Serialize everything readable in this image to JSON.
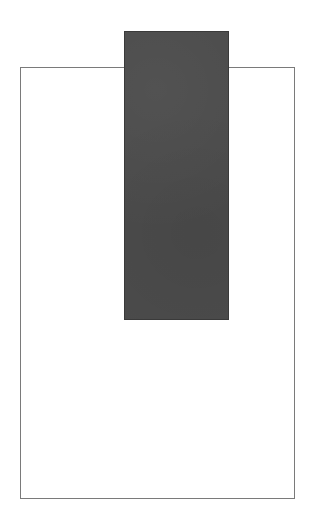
{
  "canvas": {
    "width": 314,
    "height": 529,
    "background": "#ffffff"
  },
  "shapes": {
    "outer_box": {
      "border_color": "#7a7a7a",
      "fill": "#ffffff"
    },
    "dark_block": {
      "fill": "#4b4b4b"
    }
  }
}
